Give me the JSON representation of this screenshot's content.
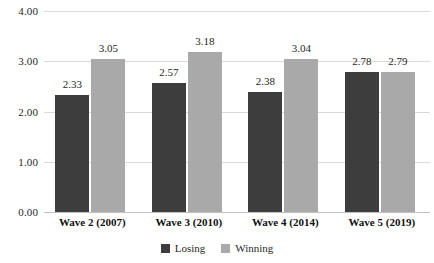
{
  "chart_data": {
    "type": "bar",
    "title": "",
    "subtitle": "",
    "xlabel": "",
    "ylabel": "",
    "ylim": [
      0,
      4
    ],
    "yticks": [
      "0.00",
      "1.00",
      "2.00",
      "3.00",
      "4.00"
    ],
    "ytick_values": [
      0,
      1,
      2,
      3,
      4
    ],
    "grid": true,
    "legend_position": "bottom",
    "categories": [
      "Wave 2 (2007)",
      "Wave 3 (2010)",
      "Wave 4 (2014)",
      "Wave 5 (2019)"
    ],
    "series": [
      {
        "name": "Losing",
        "color": "#3d3d3d",
        "values": [
          2.33,
          2.57,
          2.38,
          2.78
        ],
        "labels": [
          "2.33",
          "2.57",
          "2.38",
          "2.78"
        ]
      },
      {
        "name": "Winning",
        "color": "#a9a9a9",
        "values": [
          3.05,
          3.18,
          3.04,
          2.79
        ],
        "labels": [
          "3.05",
          "3.18",
          "3.04",
          "2.79"
        ]
      }
    ]
  },
  "legend": {
    "items": [
      {
        "label": "Losing",
        "color": "#3d3d3d"
      },
      {
        "label": "Winning",
        "color": "#a9a9a9"
      }
    ]
  },
  "colors": {
    "losing": "#3d3d3d",
    "winning": "#a9a9a9",
    "gridline": "#d9d9d9",
    "baseline": "#bfbfbf",
    "text": "#1f1f1f",
    "background": "#ffffff"
  }
}
